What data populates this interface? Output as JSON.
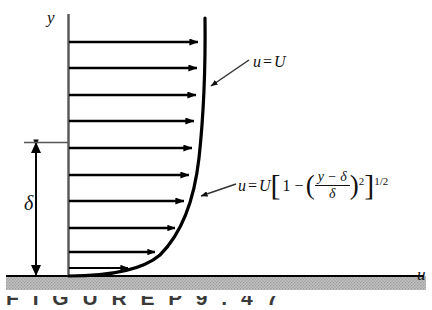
{
  "figure": {
    "axes": {
      "y_axis_label": "y",
      "x_axis_label": "u"
    },
    "labels": {
      "boundary_layer_thickness": "δ",
      "freestream_equation": "u = U",
      "profile_equation_parts": {
        "lhs": "u",
        "equals": "=",
        "U": "U",
        "bracket_open": "[",
        "one": "1",
        "minus": "−",
        "paren_open": "(",
        "numerator": "y − δ",
        "denominator": "δ",
        "paren_close": ")",
        "power_inner": "2",
        "bracket_close": "]",
        "power_outer": "1/2"
      },
      "profile_equation_plain": "u = U[1 − ((y − δ)/δ)²]^(1/2)"
    },
    "caption": "F I G U R E    P 9 . 4 7",
    "colors": {
      "line": "#000000",
      "ground_fill": "#b8b8b8",
      "background": "#ffffff",
      "leader": "#4a4a4a",
      "caption_text": "#3a3a3a"
    },
    "velocity_arrows": {
      "count": 10,
      "description": "Horizontal velocity vectors from the wall to the profile curve"
    }
  }
}
